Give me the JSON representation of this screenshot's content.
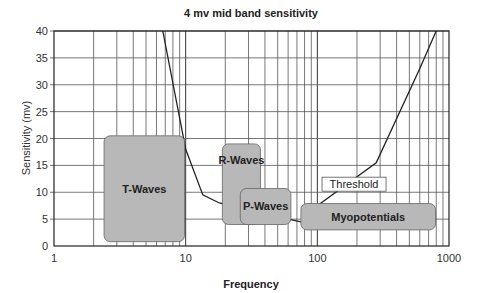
{
  "chart_data": {
    "type": "line",
    "title": "4 mv mid band sensitivity",
    "xlabel": "Frequency",
    "ylabel": "Sensitivity (mv)",
    "xscale": "log",
    "xlim": [
      1,
      1000
    ],
    "ylim": [
      0,
      40
    ],
    "grid": true,
    "x_ticks": [
      1,
      10,
      100,
      1000
    ],
    "x_tick_labels": [
      "1",
      "10",
      "100",
      "1000"
    ],
    "y_ticks": [
      0,
      5,
      10,
      15,
      20,
      25,
      30,
      35,
      40
    ],
    "y_tick_labels": [
      "0",
      "5",
      "10",
      "15",
      "20",
      "25",
      "30",
      "35",
      "40"
    ],
    "series": [
      {
        "name": "Threshold",
        "points": [
          [
            6.7,
            40
          ],
          [
            10,
            18
          ],
          [
            13.5,
            9.5
          ],
          [
            18,
            8
          ],
          [
            40,
            6
          ],
          [
            60,
            5
          ],
          [
            75,
            4.5
          ],
          [
            100,
            7.5
          ],
          [
            280,
            15.5
          ],
          [
            600,
            33
          ],
          [
            800,
            40
          ]
        ]
      }
    ],
    "annotations": [
      {
        "label": "T-Waves",
        "x_range": [
          2.4,
          9.8
        ],
        "y_range": [
          0.8,
          20.5
        ]
      },
      {
        "label": "R-Waves",
        "x_range": [
          19,
          37
        ],
        "y_range": [
          4,
          19
        ]
      },
      {
        "label": "P-Waves",
        "x_range": [
          26,
          63
        ],
        "y_range": [
          4,
          10.7
        ]
      },
      {
        "label": "Myopotentials",
        "x_range": [
          75,
          790
        ],
        "y_range": [
          3,
          7.9
        ]
      }
    ],
    "threshold_label": {
      "text": "Threshold",
      "x": 190,
      "y": 11.5
    }
  }
}
